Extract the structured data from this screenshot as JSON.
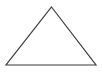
{
  "canvas": {
    "width": 102,
    "height": 77,
    "background_color": "#ffffff",
    "title": "Triangle"
  },
  "shape": {
    "name": "triangle",
    "type": "polygon",
    "label": "Triangle",
    "fill": "none",
    "fill_color": "#ffffff",
    "stroke_color": "#3a3a3a",
    "stroke_width": 1.2,
    "vertices": [
      {
        "name": "apex",
        "x": 51.5,
        "y": 7
      },
      {
        "name": "bottom-right",
        "x": 96,
        "y": 65
      },
      {
        "name": "bottom-left",
        "x": 6,
        "y": 65
      }
    ],
    "points_attr": "51.5,7 96,65 6,65"
  }
}
